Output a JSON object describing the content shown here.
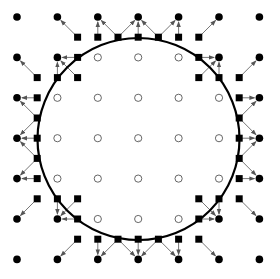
{
  "diagram": {
    "title": "",
    "grid": {
      "origin": 17,
      "spacing": 40.4,
      "count": 7
    },
    "circle": {
      "center": [
        138.5,
        139
      ],
      "radius": 101,
      "stroke": "#000000",
      "stroke_width": 2.2
    },
    "center_mark": [
      139,
      141
    ],
    "colors": {
      "filled_node": "#000000",
      "open_node_stroke": "#555555",
      "square": "#000000",
      "arrow": "#777777",
      "arrow_head": "#555555"
    },
    "quadrant_filled_nodes": [
      [
        0,
        0
      ],
      [
        1,
        0
      ],
      [
        2,
        0
      ],
      [
        3,
        0
      ],
      [
        0,
        1
      ],
      [
        1,
        1
      ],
      [
        0,
        2
      ],
      [
        0,
        3
      ]
    ],
    "quadrant_open_nodes": [
      [
        2,
        1
      ],
      [
        3,
        1
      ],
      [
        1,
        2
      ],
      [
        2,
        2
      ],
      [
        1,
        3
      ],
      [
        2,
        3
      ],
      [
        3,
        2
      ],
      [
        3,
        3
      ]
    ],
    "quadrant_squares": [
      [
        1.5,
        0.5
      ],
      [
        2,
        0.5
      ],
      [
        2.5,
        0.5
      ],
      [
        3,
        0.5
      ],
      [
        1.5,
        1
      ],
      [
        0.5,
        1.5
      ],
      [
        1,
        1.5
      ],
      [
        1.5,
        1.5
      ],
      [
        0.5,
        2
      ],
      [
        0.5,
        2.5
      ],
      [
        0.5,
        3
      ]
    ],
    "quadrant_arrows": [
      [
        [
          1.5,
          0.5
        ],
        [
          1,
          0
        ]
      ],
      [
        [
          2,
          0.5
        ],
        [
          2,
          0
        ]
      ],
      [
        [
          2.5,
          0.5
        ],
        [
          2,
          0
        ]
      ],
      [
        [
          2.5,
          0.5
        ],
        [
          3,
          0
        ]
      ],
      [
        [
          3,
          0.5
        ],
        [
          3,
          0
        ]
      ],
      [
        [
          1.5,
          1
        ],
        [
          1,
          1
        ]
      ],
      [
        [
          1.5,
          1.5
        ],
        [
          1,
          1
        ]
      ],
      [
        [
          1,
          1.5
        ],
        [
          1,
          1
        ]
      ],
      [
        [
          0.5,
          1.5
        ],
        [
          0,
          1
        ]
      ],
      [
        [
          0.5,
          2
        ],
        [
          0,
          2
        ]
      ],
      [
        [
          0.5,
          2.5
        ],
        [
          0,
          2
        ]
      ],
      [
        [
          0.5,
          2.5
        ],
        [
          0,
          3
        ]
      ],
      [
        [
          0.5,
          3
        ],
        [
          0,
          3
        ]
      ]
    ]
  }
}
